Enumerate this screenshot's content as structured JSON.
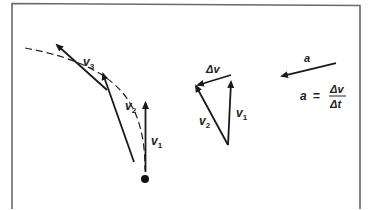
{
  "diagram": {
    "colors": {
      "ink": "#1a1a1a",
      "frame": "#6a6a6a",
      "background": "#ffffff"
    },
    "path": {
      "style": "dashed",
      "vectors": [
        {
          "id": "v1",
          "symbol": "v",
          "subscript": "1"
        },
        {
          "id": "v2",
          "symbol": "v",
          "subscript": "2"
        },
        {
          "id": "v3",
          "symbol": "v",
          "subscript": "3"
        }
      ]
    },
    "triangle": {
      "delta_v": "Δv",
      "v1": {
        "symbol": "v",
        "subscript": "1"
      },
      "v2": {
        "symbol": "v",
        "subscript": "2"
      }
    },
    "acceleration": {
      "label": "a",
      "formula": {
        "lhs": "a",
        "equals": "=",
        "numerator": "Δv",
        "denominator": "Δt"
      }
    }
  }
}
